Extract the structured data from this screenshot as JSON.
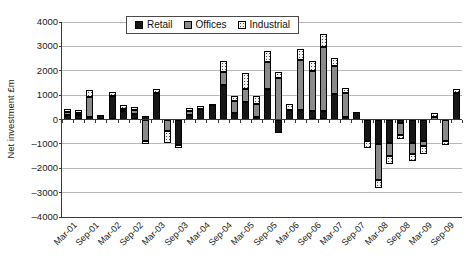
{
  "chart_data": {
    "type": "bar",
    "stacked": true,
    "title": "",
    "ylabel": "Net investment £m",
    "xlabel": "",
    "ylim": [
      -4000,
      4000
    ],
    "ytick_step": 1000,
    "ytick_labels": [
      "4000",
      "3000",
      "2000",
      "1000",
      "0",
      "–1000",
      "–2000",
      "–3000",
      "–4000"
    ],
    "grid": "horizontal",
    "legend_position": "top-center",
    "label_every_n_categories": 2,
    "categories": [
      "Mar-01",
      "Jun-01",
      "Sep-01",
      "Dec-01",
      "Mar-02",
      "Jun-02",
      "Sep-02",
      "Dec-02",
      "Mar-03",
      "Jun-03",
      "Sep-03",
      "Dec-03",
      "Mar-04",
      "Jun-04",
      "Sep-04",
      "Dec-04",
      "Mar-05",
      "Jun-05",
      "Sep-05",
      "Dec-05",
      "Mar-06",
      "Jun-06",
      "Sep-06",
      "Dec-06",
      "Mar-07",
      "Jun-07",
      "Sep-07",
      "Dec-07",
      "Mar-08",
      "Jun-08",
      "Sep-08",
      "Dec-08",
      "Mar-09",
      "Jun-09",
      "Sep-09",
      "Dec-09"
    ],
    "shown_x_labels": [
      "Mar-01",
      "Sep-01",
      "Mar-02",
      "Sep-02",
      "Mar-03",
      "Sep-03",
      "Mar-04",
      "Sep-04",
      "Mar-05",
      "Sep-05",
      "Mar-06",
      "Sep-06",
      "Mar-07",
      "Sep-07",
      "Mar-08",
      "Sep-08",
      "Mar-09",
      "Sep-09"
    ],
    "series": [
      {
        "name": "Retail",
        "color": "#161616",
        "pattern": "solid-black",
        "values": [
          200,
          190,
          100,
          170,
          980,
          350,
          230,
          150,
          1100,
          0,
          -1050,
          200,
          450,
          600,
          1400,
          250,
          700,
          100,
          1250,
          -550,
          400,
          400,
          360,
          360,
          1050,
          100,
          300,
          -880,
          -1010,
          -950,
          -150,
          -950,
          -880,
          0,
          0,
          1100
        ]
      },
      {
        "name": "Offices",
        "color": "#8a8a8a",
        "pattern": "solid-gray",
        "values": [
          120,
          90,
          820,
          0,
          0,
          100,
          170,
          -900,
          0,
          -480,
          0,
          130,
          0,
          50,
          530,
          500,
          550,
          550,
          1100,
          1700,
          0,
          2050,
          1630,
          2630,
          1130,
          1000,
          0,
          0,
          -1470,
          -530,
          -500,
          -470,
          -200,
          100,
          -900,
          0
        ]
      },
      {
        "name": "Industrial",
        "color": "#f2f2f2",
        "pattern": "dotted-light",
        "values": [
          130,
          110,
          280,
          0,
          140,
          150,
          120,
          -100,
          150,
          -470,
          -100,
          150,
          100,
          0,
          470,
          200,
          650,
          300,
          450,
          260,
          250,
          440,
          400,
          530,
          360,
          200,
          0,
          -270,
          -330,
          -330,
          -160,
          -270,
          -330,
          180,
          -150,
          150
        ]
      }
    ]
  }
}
